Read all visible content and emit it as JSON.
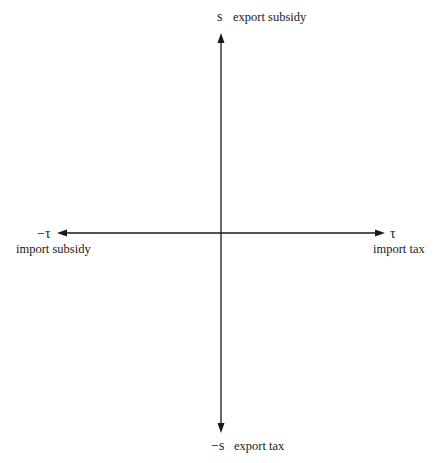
{
  "diagram": {
    "type": "policy-quadrant-axes",
    "vertical_axis": {
      "top": {
        "symbol": "s",
        "label": "export subsidy"
      },
      "bottom": {
        "symbol": "−s",
        "label": "export tax"
      }
    },
    "horizontal_axis": {
      "left": {
        "symbol": "−τ",
        "label": "import subsidy"
      },
      "right": {
        "symbol": "τ",
        "label": "import tax"
      }
    },
    "colors": {
      "line": "#1a1a1a",
      "background": "#ffffff"
    }
  }
}
